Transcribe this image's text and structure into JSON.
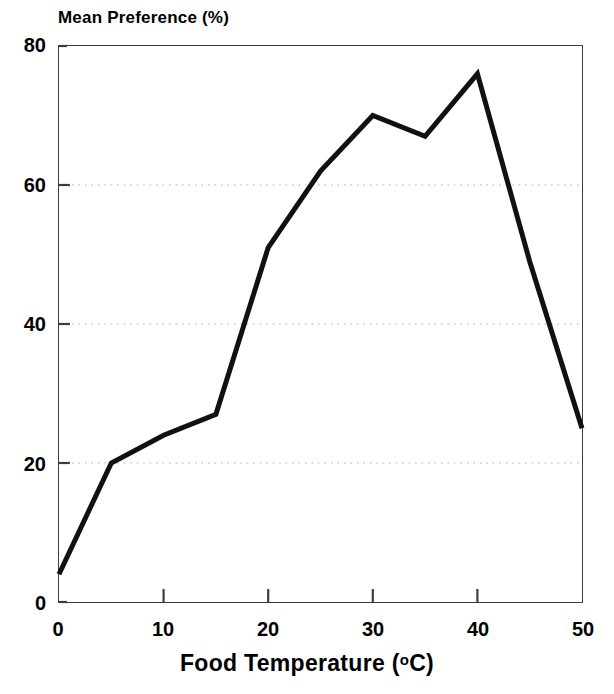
{
  "chart_data": {
    "type": "line",
    "title": "",
    "ylabel": "Mean Preference (%)",
    "xlabel": "Food Temperature (°C)",
    "xlabel_text": "Food Temperature (",
    "xlabel_degree": "o",
    "xlabel_tail": "C)",
    "x": [
      0,
      5,
      10,
      15,
      20,
      25,
      30,
      35,
      40,
      45,
      50
    ],
    "values": [
      4,
      20,
      24,
      27,
      51,
      62,
      70,
      67,
      76,
      49,
      25
    ],
    "series": [
      {
        "name": "Mean Preference",
        "values": [
          4,
          20,
          24,
          27,
          51,
          62,
          70,
          67,
          76,
          49,
          25
        ]
      }
    ],
    "xlim": [
      0,
      50
    ],
    "ylim": [
      0,
      80
    ],
    "xticks": [
      0,
      10,
      20,
      30,
      40,
      50
    ],
    "xtick_labels": [
      "0",
      "10",
      "20",
      "30",
      "40",
      "50"
    ],
    "yticks": [
      0,
      20,
      40,
      60,
      80
    ],
    "ytick_labels": [
      "0",
      "20",
      "40",
      "60",
      "80"
    ],
    "gridlines_y": [
      20,
      40,
      60
    ],
    "grid": "horizontal-dotted",
    "legend": "none",
    "line_color": "#111111",
    "grid_color": "#c8c8c8",
    "axis_color": "#3c3c3c",
    "background_color": "#ffffff",
    "line_width": 5
  }
}
